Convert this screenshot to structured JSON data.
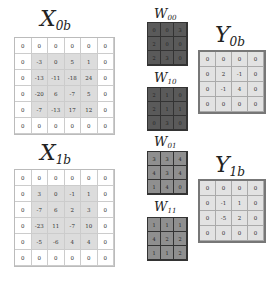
{
  "labels": {
    "x0b": {
      "base": "X",
      "sub": "0b"
    },
    "x1b": {
      "base": "X",
      "sub": "1b"
    },
    "w00": {
      "base": "W",
      "sub": "00"
    },
    "w10": {
      "base": "W",
      "sub": "10"
    },
    "w01": {
      "base": "W",
      "sub": "01"
    },
    "w11": {
      "base": "W",
      "sub": "11"
    },
    "y0b": {
      "base": "Y",
      "sub": "0b"
    },
    "y1b": {
      "base": "Y",
      "sub": "1b"
    }
  },
  "colors": {
    "w_dark": "#5a5a5a",
    "w_light": "#8f8f8f",
    "x_inner": "#dcdcdc",
    "y_fill": "#e2e2e2"
  },
  "matrices": {
    "x0b": [
      [
        "0",
        "0",
        "0",
        "0",
        "0",
        "0"
      ],
      [
        "0",
        "-3",
        "0",
        "5",
        "1",
        "0"
      ],
      [
        "0",
        "-13",
        "-11",
        "-18",
        "24",
        "0"
      ],
      [
        "0",
        "-20",
        "6",
        "-7",
        "5",
        "0"
      ],
      [
        "0",
        "-7",
        "-13",
        "17",
        "12",
        "0"
      ],
      [
        "0",
        "0",
        "0",
        "0",
        "0",
        "0"
      ]
    ],
    "x1b": [
      [
        "0",
        "0",
        "0",
        "0",
        "0",
        "0"
      ],
      [
        "0",
        "3",
        "0",
        "-1",
        "1",
        "0"
      ],
      [
        "0",
        "-7",
        "6",
        "2",
        "3",
        "0"
      ],
      [
        "0",
        "-23",
        "11",
        "-7",
        "10",
        "0"
      ],
      [
        "0",
        "-5",
        "-6",
        "4",
        "4",
        "0"
      ],
      [
        "0",
        "0",
        "0",
        "0",
        "0",
        "0"
      ]
    ],
    "w00": [
      [
        "0",
        "0",
        "3"
      ],
      [
        "2",
        "0",
        "0"
      ],
      [
        "2",
        "3",
        "0"
      ]
    ],
    "w10": [
      [
        "2",
        "1",
        "0"
      ],
      [
        "2",
        "1",
        "1"
      ],
      [
        "0",
        "3",
        "0"
      ]
    ],
    "w01": [
      [
        "3",
        "3",
        "4"
      ],
      [
        "4",
        "3",
        "4"
      ],
      [
        "1",
        "4",
        "0"
      ]
    ],
    "w11": [
      [
        "1",
        "1",
        "1"
      ],
      [
        "4",
        "2",
        "2"
      ],
      [
        "1",
        "1",
        "2"
      ]
    ],
    "y0b": [
      [
        "0",
        "0",
        "0",
        "0"
      ],
      [
        "0",
        "2",
        "-1",
        "0"
      ],
      [
        "0",
        "-1",
        "4",
        "0"
      ],
      [
        "0",
        "0",
        "0",
        "0"
      ]
    ],
    "y1b": [
      [
        "0",
        "0",
        "0",
        "0"
      ],
      [
        "0",
        "-1",
        "1",
        "0"
      ],
      [
        "0",
        "-5",
        "2",
        "0"
      ],
      [
        "0",
        "0",
        "0",
        "0"
      ]
    ]
  }
}
